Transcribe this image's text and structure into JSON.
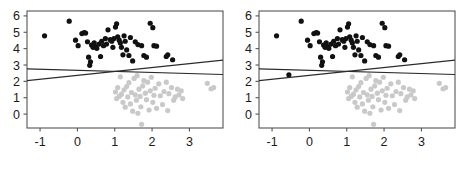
{
  "figure": {
    "background": "#ffffff",
    "panel_count": 2
  },
  "chart_data": [
    {
      "type": "scatter",
      "title": "",
      "panel_label": "left",
      "xlabel": "",
      "ylabel": "",
      "xlim": [
        -1.35,
        3.9
      ],
      "ylim": [
        -0.85,
        6.3
      ],
      "xticks": [
        -1,
        0,
        1,
        2,
        3
      ],
      "xticklabels": [
        "-1",
        "0",
        "1",
        "2",
        "3"
      ],
      "yticks": [
        0,
        1,
        2,
        3,
        4,
        5,
        6
      ],
      "yticklabels": [
        "0",
        "1",
        "2",
        "3",
        "4",
        "5",
        "6"
      ],
      "grid": false,
      "legend": "none",
      "series": [
        {
          "name": "black-group",
          "color": "#111111",
          "marker": "filled-circle",
          "points": [
            [
              -0.88,
              4.78
            ],
            [
              -0.22,
              5.68
            ],
            [
              -0.05,
              4.52
            ],
            [
              0.02,
              4.18
            ],
            [
              0.12,
              4.92
            ],
            [
              0.18,
              4.98
            ],
            [
              0.22,
              4.95
            ],
            [
              0.27,
              4.42
            ],
            [
              0.3,
              3.48
            ],
            [
              0.33,
              2.98
            ],
            [
              0.35,
              3.2
            ],
            [
              0.38,
              4.22
            ],
            [
              0.42,
              4.08
            ],
            [
              0.45,
              4.35
            ],
            [
              0.48,
              4.12
            ],
            [
              0.52,
              4.02
            ],
            [
              0.58,
              4.28
            ],
            [
              0.62,
              3.52
            ],
            [
              0.65,
              4.45
            ],
            [
              0.7,
              4.18
            ],
            [
              0.75,
              4.62
            ],
            [
              0.78,
              4.28
            ],
            [
              0.82,
              5.15
            ],
            [
              0.88,
              4.55
            ],
            [
              0.92,
              4.45
            ],
            [
              0.95,
              4.08
            ],
            [
              0.98,
              4.62
            ],
            [
              1.02,
              5.32
            ],
            [
              1.05,
              5.52
            ],
            [
              1.08,
              4.72
            ],
            [
              1.12,
              4.52
            ],
            [
              1.15,
              4.35
            ],
            [
              1.18,
              4.08
            ],
            [
              1.22,
              3.62
            ],
            [
              1.25,
              4.78
            ],
            [
              1.28,
              4.45
            ],
            [
              1.32,
              3.92
            ],
            [
              1.38,
              3.58
            ],
            [
              1.42,
              4.68
            ],
            [
              1.48,
              3.25
            ],
            [
              1.55,
              4.42
            ],
            [
              1.62,
              4.25
            ],
            [
              1.72,
              4.18
            ],
            [
              1.78,
              3.58
            ],
            [
              1.85,
              3.48
            ],
            [
              1.95,
              5.55
            ],
            [
              2.02,
              5.28
            ],
            [
              2.05,
              4.18
            ],
            [
              2.12,
              4.15
            ],
            [
              2.38,
              3.52
            ],
            [
              2.42,
              3.62
            ],
            [
              2.55,
              3.32
            ]
          ]
        },
        {
          "name": "gray-group",
          "color": "#c9c9c9",
          "marker": "filled-circle",
          "points": [
            [
              1.02,
              1.35
            ],
            [
              1.05,
              0.95
            ],
            [
              1.08,
              1.62
            ],
            [
              1.12,
              1.08
            ],
            [
              1.15,
              2.28
            ],
            [
              1.18,
              1.22
            ],
            [
              1.22,
              0.72
            ],
            [
              1.25,
              1.48
            ],
            [
              1.28,
              0.42
            ],
            [
              1.32,
              1.68
            ],
            [
              1.35,
              1.05
            ],
            [
              1.38,
              1.92
            ],
            [
              1.42,
              0.62
            ],
            [
              1.45,
              1.32
            ],
            [
              1.48,
              0.18
            ],
            [
              1.52,
              2.18
            ],
            [
              1.55,
              1.18
            ],
            [
              1.58,
              0.85
            ],
            [
              1.6,
              2.35
            ],
            [
              1.62,
              0.05
            ],
            [
              1.65,
              1.52
            ],
            [
              1.68,
              1.08
            ],
            [
              1.7,
              0.45
            ],
            [
              1.72,
              -0.62
            ],
            [
              1.75,
              1.72
            ],
            [
              1.78,
              2.05
            ],
            [
              1.82,
              1.28
            ],
            [
              1.85,
              0.88
            ],
            [
              1.88,
              1.95
            ],
            [
              1.92,
              0.25
            ],
            [
              1.95,
              1.42
            ],
            [
              1.98,
              2.25
            ],
            [
              2.02,
              0.72
            ],
            [
              2.05,
              1.15
            ],
            [
              2.08,
              1.58
            ],
            [
              2.12,
              0.35
            ],
            [
              2.18,
              1.85
            ],
            [
              2.22,
              1.12
            ],
            [
              2.28,
              0.58
            ],
            [
              2.32,
              1.38
            ],
            [
              2.38,
              1.95
            ],
            [
              2.42,
              0.22
            ],
            [
              2.45,
              1.25
            ],
            [
              2.52,
              1.62
            ],
            [
              2.58,
              0.85
            ],
            [
              2.62,
              1.05
            ],
            [
              2.68,
              1.52
            ],
            [
              2.72,
              1.18
            ],
            [
              2.78,
              1.42
            ],
            [
              2.82,
              0.95
            ],
            [
              3.48,
              1.88
            ],
            [
              3.58,
              1.55
            ],
            [
              3.65,
              1.62
            ]
          ]
        }
      ],
      "lines": [
        {
          "name": "flat-line",
          "color": "#2b2b2b",
          "x_start": -1.35,
          "y_start": 2.76,
          "x_end": 3.9,
          "y_end": 2.42
        },
        {
          "name": "sloped-line",
          "color": "#2b2b2b",
          "x_start": -1.35,
          "y_start": 2.05,
          "x_end": 3.9,
          "y_end": 3.3
        }
      ]
    },
    {
      "type": "scatter",
      "title": "",
      "panel_label": "right",
      "xlabel": "",
      "ylabel": "",
      "xlim": [
        -1.35,
        3.9
      ],
      "ylim": [
        -0.85,
        6.3
      ],
      "xticks": [
        -1,
        0,
        1,
        2,
        3
      ],
      "xticklabels": [
        "-1",
        "0",
        "1",
        "2",
        "3"
      ],
      "yticks": [
        0,
        1,
        2,
        3,
        4,
        5,
        6
      ],
      "yticklabels": [
        "0",
        "1",
        "2",
        "3",
        "4",
        "5",
        "6"
      ],
      "grid": false,
      "legend": "none",
      "series": [
        {
          "name": "black-group",
          "color": "#111111",
          "marker": "filled-circle",
          "points": [
            [
              -0.88,
              4.78
            ],
            [
              -0.55,
              2.4
            ],
            [
              -0.22,
              5.68
            ],
            [
              -0.05,
              4.52
            ],
            [
              0.02,
              4.18
            ],
            [
              0.12,
              4.92
            ],
            [
              0.18,
              4.98
            ],
            [
              0.22,
              4.95
            ],
            [
              0.27,
              4.42
            ],
            [
              0.3,
              3.48
            ],
            [
              0.33,
              2.98
            ],
            [
              0.35,
              3.2
            ],
            [
              0.38,
              4.22
            ],
            [
              0.42,
              4.08
            ],
            [
              0.45,
              4.35
            ],
            [
              0.48,
              4.12
            ],
            [
              0.52,
              4.02
            ],
            [
              0.58,
              4.28
            ],
            [
              0.62,
              3.52
            ],
            [
              0.65,
              4.45
            ],
            [
              0.7,
              4.18
            ],
            [
              0.75,
              4.62
            ],
            [
              0.78,
              4.28
            ],
            [
              0.82,
              5.15
            ],
            [
              0.88,
              4.55
            ],
            [
              0.92,
              4.45
            ],
            [
              0.95,
              4.08
            ],
            [
              0.98,
              4.62
            ],
            [
              1.02,
              5.32
            ],
            [
              1.05,
              5.52
            ],
            [
              1.08,
              4.72
            ],
            [
              1.12,
              4.52
            ],
            [
              1.15,
              4.35
            ],
            [
              1.18,
              4.08
            ],
            [
              1.22,
              3.62
            ],
            [
              1.25,
              4.78
            ],
            [
              1.28,
              4.45
            ],
            [
              1.32,
              3.92
            ],
            [
              1.38,
              3.58
            ],
            [
              1.42,
              4.68
            ],
            [
              1.48,
              3.25
            ],
            [
              1.55,
              4.42
            ],
            [
              1.62,
              4.25
            ],
            [
              1.72,
              4.18
            ],
            [
              1.78,
              3.58
            ],
            [
              1.85,
              3.48
            ],
            [
              1.95,
              5.55
            ],
            [
              2.02,
              5.28
            ],
            [
              2.05,
              4.18
            ],
            [
              2.12,
              4.15
            ],
            [
              2.38,
              3.52
            ],
            [
              2.42,
              3.62
            ],
            [
              2.55,
              3.32
            ]
          ]
        },
        {
          "name": "gray-group",
          "color": "#c9c9c9",
          "marker": "filled-circle",
          "points": [
            [
              1.02,
              1.35
            ],
            [
              1.05,
              0.95
            ],
            [
              1.08,
              1.62
            ],
            [
              1.12,
              1.08
            ],
            [
              1.15,
              2.28
            ],
            [
              1.18,
              1.22
            ],
            [
              1.22,
              0.72
            ],
            [
              1.25,
              1.48
            ],
            [
              1.28,
              0.42
            ],
            [
              1.32,
              1.68
            ],
            [
              1.35,
              1.05
            ],
            [
              1.38,
              1.92
            ],
            [
              1.42,
              0.62
            ],
            [
              1.45,
              1.32
            ],
            [
              1.48,
              0.18
            ],
            [
              1.52,
              2.18
            ],
            [
              1.55,
              1.18
            ],
            [
              1.58,
              0.85
            ],
            [
              1.6,
              2.35
            ],
            [
              1.62,
              0.05
            ],
            [
              1.65,
              1.52
            ],
            [
              1.68,
              1.08
            ],
            [
              1.7,
              0.45
            ],
            [
              1.72,
              -0.62
            ],
            [
              1.75,
              1.72
            ],
            [
              1.78,
              2.05
            ],
            [
              1.82,
              1.28
            ],
            [
              1.85,
              0.88
            ],
            [
              1.88,
              1.95
            ],
            [
              1.92,
              0.25
            ],
            [
              1.95,
              1.42
            ],
            [
              1.98,
              2.25
            ],
            [
              2.02,
              0.72
            ],
            [
              2.05,
              1.15
            ],
            [
              2.08,
              1.58
            ],
            [
              2.12,
              0.35
            ],
            [
              2.18,
              1.85
            ],
            [
              2.22,
              1.12
            ],
            [
              2.28,
              0.58
            ],
            [
              2.32,
              1.38
            ],
            [
              2.38,
              1.95
            ],
            [
              2.42,
              0.22
            ],
            [
              2.45,
              1.25
            ],
            [
              2.52,
              1.62
            ],
            [
              2.58,
              0.85
            ],
            [
              2.62,
              1.05
            ],
            [
              2.68,
              1.52
            ],
            [
              2.72,
              1.18
            ],
            [
              2.78,
              1.42
            ],
            [
              2.82,
              0.95
            ],
            [
              3.48,
              1.88
            ],
            [
              3.58,
              1.55
            ],
            [
              3.65,
              1.62
            ]
          ]
        }
      ],
      "lines": [
        {
          "name": "flat-line",
          "color": "#2b2b2b",
          "x_start": -1.35,
          "y_start": 2.76,
          "x_end": 3.9,
          "y_end": 2.42
        },
        {
          "name": "sloped-line",
          "color": "#2b2b2b",
          "x_start": -1.35,
          "y_start": 2.05,
          "x_end": 3.9,
          "y_end": 3.3
        }
      ]
    }
  ]
}
